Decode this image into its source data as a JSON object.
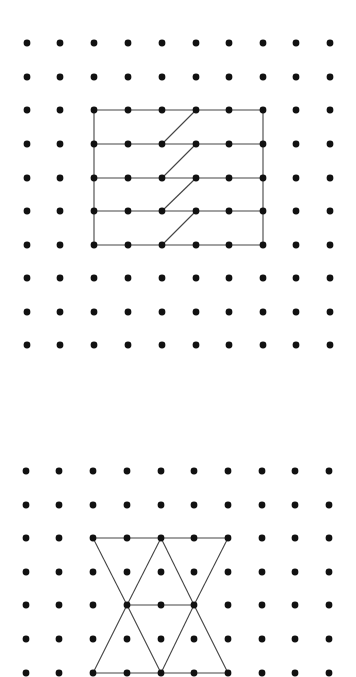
{
  "figure": {
    "width": 356,
    "height": 677,
    "background": "#ffffff",
    "dot_color": "#111111",
    "line_color": "#444444",
    "dot_radius": 3.4,
    "line_width": 1.1
  },
  "grids": [
    {
      "name": "top-dot-grid",
      "col_x": [
        27,
        60,
        94,
        128,
        162,
        196,
        229,
        263,
        296,
        330
      ],
      "row_y": [
        43,
        77,
        110,
        144,
        178,
        211,
        245,
        278,
        312,
        345
      ],
      "figure_name": "rectangle-with-staggered-diagonals",
      "segments": [
        [
          2,
          2,
          7,
          2
        ],
        [
          2,
          3,
          7,
          3
        ],
        [
          2,
          4,
          7,
          4
        ],
        [
          2,
          5,
          7,
          5
        ],
        [
          2,
          6,
          7,
          6
        ],
        [
          2,
          2,
          2,
          6
        ],
        [
          7,
          2,
          7,
          6
        ],
        [
          4,
          3,
          5,
          2
        ],
        [
          4,
          4,
          5,
          3
        ],
        [
          4,
          5,
          5,
          4
        ],
        [
          4,
          6,
          5,
          5
        ]
      ]
    },
    {
      "name": "bottom-dot-grid",
      "col_x": [
        26,
        59,
        93,
        127,
        161,
        194,
        228,
        262,
        295,
        329
      ],
      "row_y": [
        471,
        505,
        538,
        572,
        605,
        639,
        673
      ],
      "figure_name": "triangle-hourglass-figure",
      "segments": [
        [
          2,
          2,
          6,
          2
        ],
        [
          2,
          6,
          6,
          6
        ],
        [
          3,
          4,
          5,
          4
        ],
        [
          2,
          2,
          3,
          4
        ],
        [
          3,
          4,
          4,
          2
        ],
        [
          4,
          2,
          5,
          4
        ],
        [
          5,
          4,
          6,
          2
        ],
        [
          3,
          4,
          2,
          6
        ],
        [
          3,
          4,
          4,
          6
        ],
        [
          4,
          6,
          5,
          4
        ],
        [
          5,
          4,
          6,
          6
        ]
      ]
    }
  ]
}
